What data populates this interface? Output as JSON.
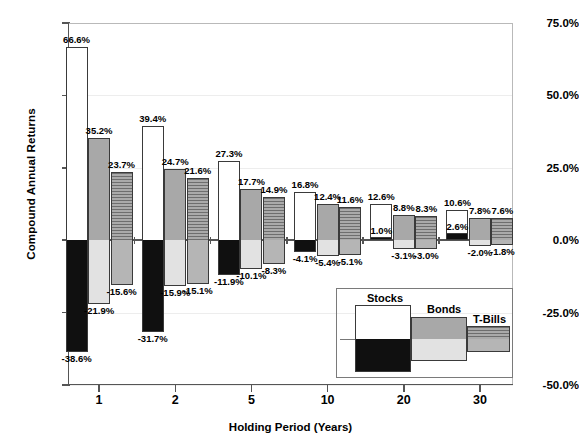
{
  "chart_data": {
    "type": "bar",
    "title": "",
    "xlabel": "Holding Period (Years)",
    "ylabel": "Compound Annual Returns",
    "categories": [
      "1",
      "2",
      "5",
      "10",
      "20",
      "30"
    ],
    "ylim": [
      -50.0,
      75.0
    ],
    "ytick_labels": [
      "75.0%",
      "50.0%",
      "25.0%",
      "0.0%",
      "-25.0%",
      "-50.0%"
    ],
    "ytick_values": [
      75.0,
      50.0,
      25.0,
      0.0,
      -25.0,
      -50.0
    ],
    "grid": false,
    "legend_position": "inside-bottom-right",
    "note": "Each series plots a best (maximum) and worst (minimum) compound annual return for the given holding period.",
    "series": [
      {
        "name": "Stocks",
        "fill_top": "#ffffff",
        "fill_bottom": "#101010",
        "max_values": [
          66.6,
          39.4,
          27.3,
          16.8,
          12.6,
          10.6
        ],
        "min_values": [
          -38.6,
          -31.7,
          -11.9,
          -4.1,
          1.0,
          2.6
        ],
        "max_labels": [
          "66.6%",
          "39.4%",
          "27.3%",
          "16.8%",
          "12.6%",
          "10.6%"
        ],
        "min_labels": [
          "-38.6%",
          "-31.7%",
          "-11.9%",
          "-4.1%",
          "1.0%",
          "2.6%"
        ]
      },
      {
        "name": "Bonds",
        "fill_top": "#a8a8a8",
        "fill_bottom": "#e2e2e2",
        "max_values": [
          35.2,
          24.7,
          17.7,
          12.4,
          8.8,
          7.8
        ],
        "min_values": [
          -21.9,
          -15.9,
          -10.1,
          -5.4,
          -3.1,
          -2.0
        ],
        "max_labels": [
          "35.2%",
          "24.7%",
          "17.7%",
          "12.4%",
          "8.8%",
          "7.8%"
        ],
        "min_labels": [
          "-21.9%",
          "-15.9%",
          "-10.1%",
          "-5.4%",
          "-3.1%",
          "-2.0%"
        ]
      },
      {
        "name": "T-Bills",
        "fill_top": "#8f8f8f",
        "fill_bottom": "#b5b5b5",
        "max_values": [
          23.7,
          21.6,
          14.9,
          11.6,
          8.3,
          7.6
        ],
        "min_values": [
          -15.6,
          -15.1,
          -8.3,
          -5.1,
          -3.0,
          -1.8
        ],
        "max_labels": [
          "23.7%",
          "21.6%",
          "14.9%",
          "11.6%",
          "8.3%",
          "7.6%"
        ],
        "min_labels": [
          "-15.6%",
          "-15.1%",
          "-8.3%",
          "-5.1%",
          "-3.0%",
          "-1.8%"
        ]
      }
    ]
  },
  "legend": {
    "items": [
      {
        "label": "Stocks"
      },
      {
        "label": "Bonds"
      },
      {
        "label": "T-Bills"
      }
    ]
  }
}
